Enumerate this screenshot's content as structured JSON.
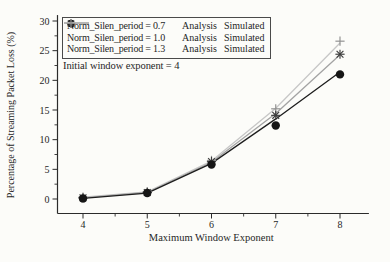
{
  "figure": {
    "background": "#fcfcf9",
    "annotation": "Initial window exponent = 4"
  },
  "chart_data": {
    "type": "line",
    "title": "",
    "xlabel": "Maximum Window Exponent",
    "ylabel": "Percentage of Streaming Packet Loss (%)",
    "x": [
      4,
      5,
      6,
      7,
      8
    ],
    "xticks": [
      4,
      5,
      6,
      7,
      8
    ],
    "xminorticks": [
      4.5,
      5.5,
      6.5,
      7.5
    ],
    "yticks": [
      0,
      5,
      10,
      15,
      20,
      25,
      30
    ],
    "yminorticks": [
      2.5,
      7.5,
      12.5,
      17.5,
      22.5,
      27.5
    ],
    "xlim": [
      3.6,
      8.45
    ],
    "ylim": [
      -2.4,
      31
    ],
    "grid": false,
    "legend_position": "top-left",
    "axis_color": "#2b2b2b",
    "text_color": "#262626",
    "series": [
      {
        "name": "Norm_Silen_period = 0.7",
        "analysis_label": "Analysis",
        "simulated_label": "Simulated",
        "marker": "circle",
        "line_color": "#1d1d1d",
        "marker_color": "#161616",
        "analysis_values": [
          0.1,
          1.0,
          6.0,
          13.5,
          21.4
        ],
        "simulated_values": [
          0.1,
          1.0,
          5.8,
          12.4,
          21.0
        ]
      },
      {
        "name": "Norm_Silen_period = 1.0",
        "analysis_label": "Analysis",
        "simulated_label": "Simulated",
        "marker": "asterisk",
        "line_color": "#a3a3a3",
        "marker_color": "#3c3c3c",
        "analysis_values": [
          0.2,
          1.1,
          6.2,
          14.4,
          24.3
        ],
        "simulated_values": [
          0.2,
          1.1,
          6.3,
          14.1,
          24.4
        ]
      },
      {
        "name": "Norm_Silen_period = 1.3",
        "analysis_label": "Analysis",
        "simulated_label": "Simulated",
        "marker": "plus",
        "line_color": "#c7c7c7",
        "marker_color": "#8f8f8f",
        "analysis_values": [
          0.3,
          1.2,
          6.4,
          15.3,
          26.3
        ],
        "simulated_values": [
          0.3,
          1.2,
          6.5,
          15.2,
          26.6
        ]
      }
    ]
  }
}
